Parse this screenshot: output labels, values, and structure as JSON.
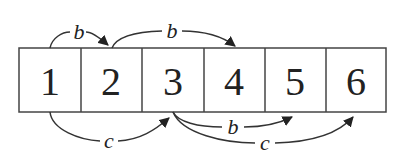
{
  "diagram": {
    "cells": [
      "1",
      "2",
      "3",
      "4",
      "5",
      "6"
    ],
    "edges": [
      {
        "from": "1",
        "to": "2",
        "label": "b",
        "side": "top"
      },
      {
        "from": "2",
        "to": "4",
        "label": "b",
        "side": "top"
      },
      {
        "from": "1",
        "to": "3",
        "label": "c",
        "side": "bottom"
      },
      {
        "from": "3",
        "to": "5",
        "label": "b",
        "side": "bottom"
      },
      {
        "from": "3",
        "to": "6",
        "label": "c",
        "side": "bottom"
      }
    ]
  }
}
